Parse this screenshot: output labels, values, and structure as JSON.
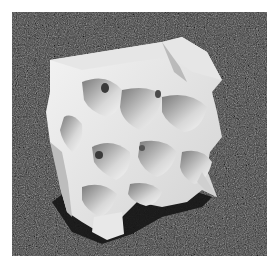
{
  "image": {
    "subject": "3D printed white gyroid lattice cube resting on dark gravel surface",
    "alt": "White gyroid lattice structure on gravel",
    "colors": {
      "ground": "#3e3e3e",
      "object_light": "#f2f2f2",
      "object_mid": "#c8c8c8",
      "object_shadow": "#8a8a8a",
      "cast_shadow": "#151515"
    }
  }
}
